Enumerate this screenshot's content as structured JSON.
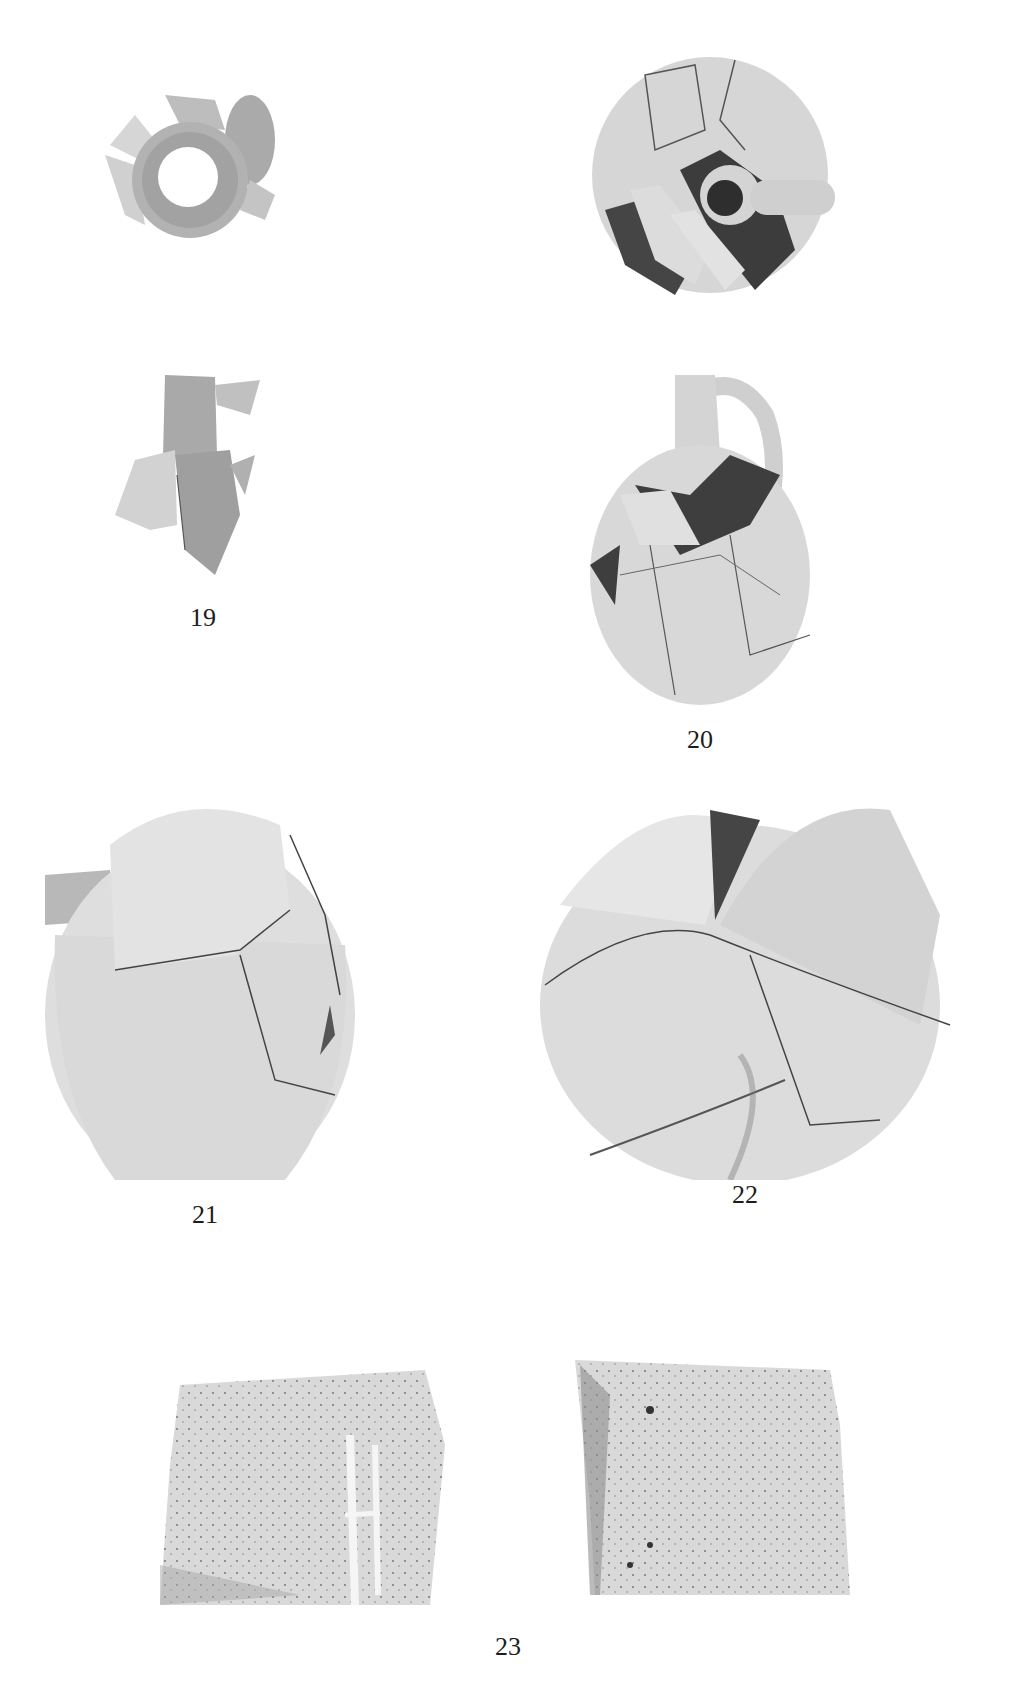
{
  "plate": {
    "figures": [
      {
        "id": "19",
        "caption": "19",
        "views": [
          "top-view",
          "side-view"
        ],
        "description": "Fragmentary juglet with cylindrical neck"
      },
      {
        "id": "20",
        "caption": "20",
        "views": [
          "top-view",
          "side-view"
        ],
        "description": "Restored jug with loop handle"
      },
      {
        "id": "21",
        "caption": "21",
        "views": [
          "side-view"
        ],
        "description": "Restored ovoid jar"
      },
      {
        "id": "22",
        "caption": "22",
        "views": [
          "side-view"
        ],
        "description": "Restored ovoid jar"
      },
      {
        "id": "23",
        "caption": "23",
        "views": [
          "exterior",
          "interior"
        ],
        "description": "Sherd with incised mark"
      }
    ]
  },
  "colors": {
    "background": "#ffffff",
    "clay_light": "#e2e2e2",
    "clay_mid": "#c9c9c9",
    "clay_dark": "#9a9a9a",
    "void": "#3a3a3a",
    "crack": "#555555"
  }
}
